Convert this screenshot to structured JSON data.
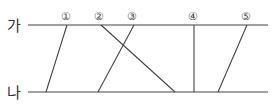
{
  "diagram": {
    "lines": {
      "top": {
        "label": "가",
        "y": 25,
        "x1": 28,
        "x2": 268
      },
      "bottom": {
        "label": "나",
        "y": 92,
        "x1": 28,
        "x2": 268
      }
    },
    "segments": [
      {
        "marker": "①",
        "top_x": 67,
        "bottom_x": 46
      },
      {
        "marker": "②",
        "top_x": 101,
        "bottom_x": 175
      },
      {
        "marker": "③",
        "top_x": 134,
        "bottom_x": 98
      },
      {
        "marker": "④",
        "top_x": 194,
        "bottom_x": 194
      },
      {
        "marker": "⑤",
        "top_x": 247,
        "bottom_x": 218
      }
    ],
    "line_color": "#444444"
  }
}
